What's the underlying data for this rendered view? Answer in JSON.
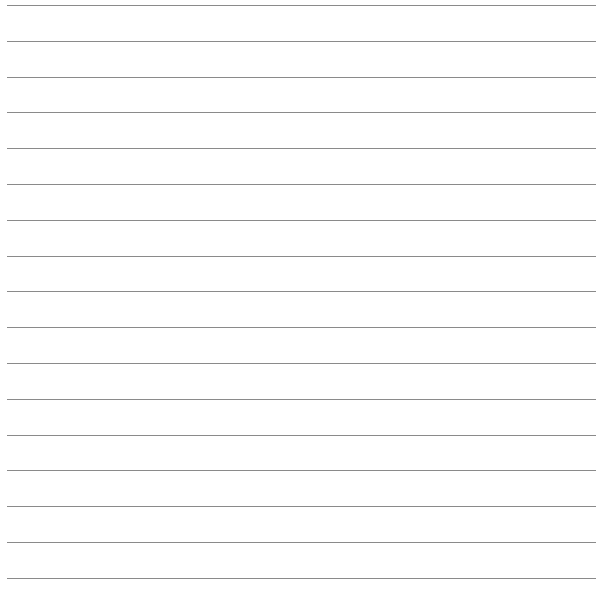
{
  "paper": {
    "type": "lined paper",
    "line_count": 17,
    "line_color": "#8a8a8a",
    "background": "#ffffff"
  }
}
